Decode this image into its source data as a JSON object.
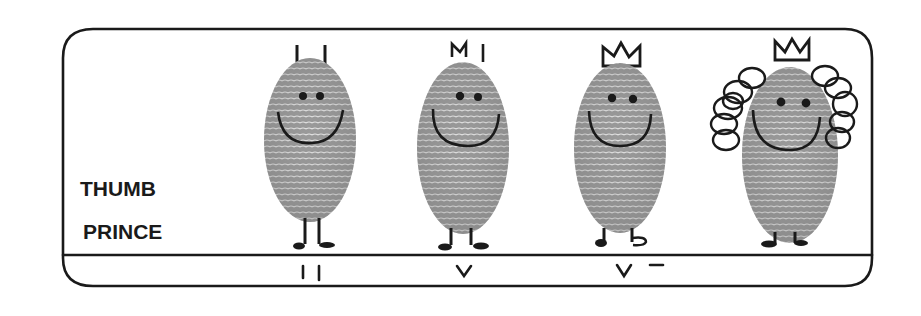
{
  "illustration": {
    "title_line1": "THUMB",
    "title_line2": "PRINCE",
    "ink_color": "#1a1a1a",
    "print_color": "#8a8a8a",
    "background": "#ffffff",
    "figures": [
      {
        "stage": "II",
        "headgear": "two-antenna-stubs"
      },
      {
        "stage": "V",
        "headgear": "small-crown-sprouting"
      },
      {
        "stage": "V –",
        "headgear": "crown"
      },
      {
        "stage": "",
        "headgear": "crown-with-curly-wig"
      }
    ]
  }
}
